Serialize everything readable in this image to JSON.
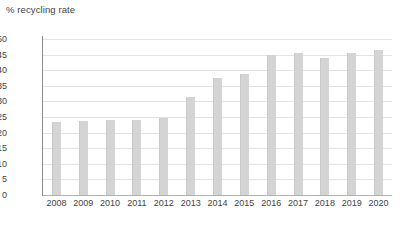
{
  "chart_data": {
    "type": "bar",
    "title": "% recycling rate",
    "xlabel": "",
    "ylabel": "% recycling rate",
    "categories": [
      "2008",
      "2009",
      "2010",
      "2011",
      "2012",
      "2013",
      "2014",
      "2015",
      "2016",
      "2017",
      "2018",
      "2019",
      "2020"
    ],
    "values": [
      23.5,
      23.8,
      23.9,
      24.0,
      24.7,
      31.3,
      37.5,
      38.8,
      44.8,
      45.5,
      43.8,
      45.5,
      46.6
    ],
    "series": [
      {
        "name": "% recycling rate",
        "values": [
          23.5,
          23.8,
          23.9,
          24.0,
          24.7,
          31.3,
          37.5,
          38.8,
          44.8,
          45.5,
          43.8,
          45.5,
          46.6
        ]
      }
    ],
    "ylim": [
      0,
      50
    ],
    "yticks": [
      0,
      5,
      10,
      15,
      20,
      25,
      30,
      35,
      40,
      45,
      50
    ],
    "ytick_labels": [
      "0",
      "5",
      "10",
      "15",
      "20",
      "25",
      "30",
      "35",
      "40",
      "45",
      "50"
    ],
    "grid": true,
    "legend": false,
    "legend_position": "none",
    "bar_color": "#d4d4d4",
    "gridline_color": "#e2e2e2",
    "axis_color": "#8c8c8c",
    "text_color": "#3f3f3f",
    "background_color": "#ffffff"
  }
}
